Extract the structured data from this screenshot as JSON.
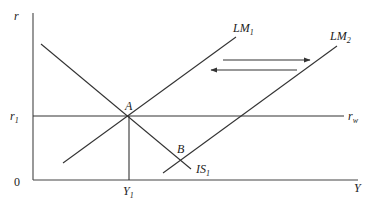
{
  "diagram": {
    "axes": {
      "y_label": "r",
      "x_label": "Y",
      "origin_label": "0"
    },
    "levels": {
      "r1_label": "r",
      "r1_sub": "1",
      "rw_label": "r",
      "rw_sub": "w",
      "y1_label": "Y",
      "y1_sub": "1"
    },
    "curves": [
      {
        "name": "IS",
        "label": "IS",
        "sub": "1"
      },
      {
        "name": "LM1",
        "label": "LM",
        "sub": "1"
      },
      {
        "name": "LM2",
        "label": "LM",
        "sub": "2"
      }
    ],
    "points": [
      {
        "label": "A"
      },
      {
        "label": "B"
      }
    ],
    "arrows": [
      {
        "direction": "right"
      },
      {
        "direction": "left"
      }
    ]
  }
}
